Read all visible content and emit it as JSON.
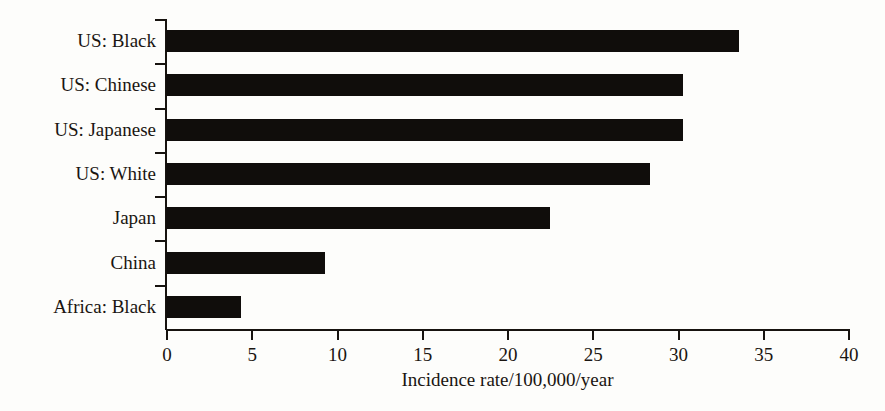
{
  "chart_data": {
    "type": "bar",
    "orientation": "horizontal",
    "title": "",
    "subtitle": "",
    "xlabel": "Incidence rate/100,000/year",
    "ylabel": "",
    "categories": [
      "US: Black",
      "US: Chinese",
      "US: Japanese",
      "US: White",
      "Japan",
      "China",
      "Africa: Black"
    ],
    "values": [
      33.6,
      30.3,
      30.3,
      28.4,
      22.5,
      9.3,
      4.4
    ],
    "xlim": [
      0,
      40
    ],
    "xticks": [
      0,
      5,
      10,
      15,
      20,
      25,
      30,
      35,
      40
    ],
    "xtick_labels": [
      "0",
      "5",
      "10",
      "15",
      "20",
      "25",
      "30",
      "35",
      "40"
    ],
    "grid": false,
    "legend": false,
    "legend_position": "none",
    "bar_color": "#100d0b",
    "axis_color": "#17130f",
    "background_color": "#fdfdfb"
  }
}
